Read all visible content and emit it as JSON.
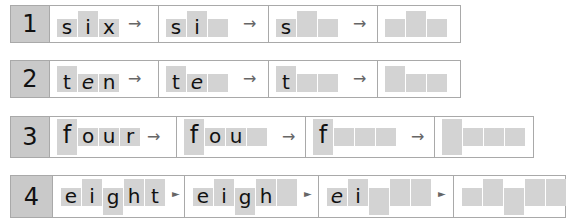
{
  "worksheet": {
    "rows": [
      {
        "number": "1",
        "word": "six",
        "steps": [
          [
            "s",
            "i",
            "x"
          ],
          [
            "s",
            "i",
            ""
          ],
          [
            "s",
            "",
            ""
          ],
          [
            "",
            "",
            ""
          ]
        ],
        "arrow": "→"
      },
      {
        "number": "2",
        "word": "ten",
        "steps": [
          [
            "t",
            "e",
            "n"
          ],
          [
            "t",
            "e",
            ""
          ],
          [
            "t",
            "",
            ""
          ],
          [
            "",
            "",
            ""
          ]
        ],
        "arrow": "→"
      },
      {
        "number": "3",
        "word": "four",
        "steps": [
          [
            "f",
            "o",
            "u",
            "r"
          ],
          [
            "f",
            "o",
            "u",
            ""
          ],
          [
            "f",
            "",
            "",
            ""
          ],
          [
            "",
            "",
            "",
            ""
          ]
        ],
        "arrow": "→"
      },
      {
        "number": "4",
        "word": "eight",
        "steps": [
          [
            "e",
            "i",
            "g",
            "h",
            "t"
          ],
          [
            "e",
            "i",
            "g",
            "h",
            ""
          ],
          [
            "e",
            "i",
            "",
            "",
            ""
          ],
          [
            "",
            "",
            "",
            "",
            ""
          ]
        ],
        "arrow": "►"
      }
    ],
    "colors": {
      "number_box": "#c9c9c9",
      "letter_box": "#d3d3d3",
      "border": "#a9a9a9"
    }
  }
}
